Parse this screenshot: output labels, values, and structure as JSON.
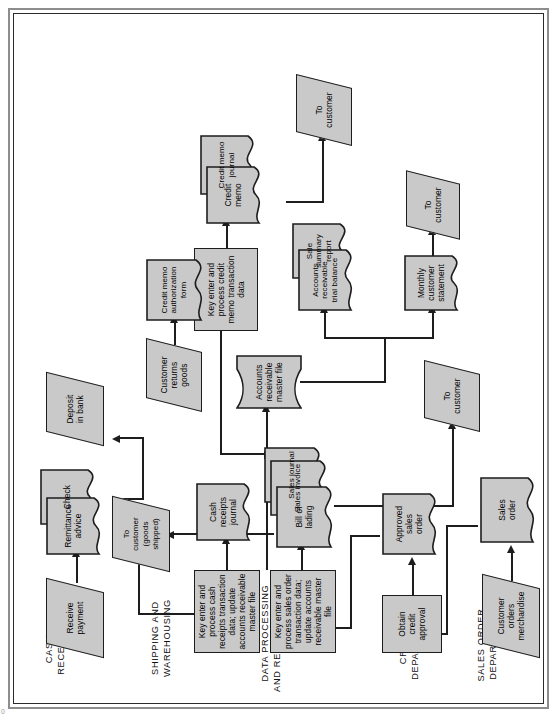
{
  "figure": {
    "kind": "document-flowchart",
    "page_mark": "0",
    "fill_color": "#c9c9c9",
    "line_color": "#1d1d1d",
    "frame_color": "#8d8d8d",
    "orientation": "rotated 90 degrees counter-clockwise (landscape chart on portrait page)"
  },
  "columns": [
    {
      "id": "sales-order",
      "label": "SALES ORDER\nDEPARTMENT"
    },
    {
      "id": "credit",
      "label": "CREDIT\nDEPARTMENT"
    },
    {
      "id": "data-processing",
      "label": "DATA PROCESSING\nAND RECORD KEEPING"
    },
    {
      "id": "shipping",
      "label": "SHIPPING AND\nWAREHOUSING"
    },
    {
      "id": "cash-receipts",
      "label": "CASH\nRECEIPTS"
    }
  ],
  "nodes": {
    "customer_orders": {
      "label": "Customer\norders\nmerchandise",
      "shape": "io"
    },
    "sales_order": {
      "label": "Sales\norder",
      "shape": "document"
    },
    "obtain_credit_approval": {
      "label": "Obtain\ncredit\napproval",
      "shape": "process"
    },
    "approved_sales_order": {
      "label": "Approved\nsales\norder",
      "shape": "document"
    },
    "key_sales_order": {
      "label": "Key enter and\nprocess sales order\ntransaction data;\nupdate accounts\nreceivable master file",
      "shape": "process"
    },
    "key_cash_receipts": {
      "label": "Key enter and\nprocess cash\nreceipts transaction\ndata; update\naccounts receivable\nmaster file",
      "shape": "process"
    },
    "key_credit_memo": {
      "label": "Key enter and\nprocess credit\nmemo transaction\ndata",
      "shape": "process"
    },
    "bill_of_lading": {
      "label": "Bill of\nlading",
      "shape": "document"
    },
    "sales_invoice": {
      "label": "Sales invoice",
      "shape": "document"
    },
    "sales_journal": {
      "label": "Sales journal",
      "shape": "document"
    },
    "cash_receipts_journal": {
      "label": "Cash\nreceipts\njournal",
      "shape": "document"
    },
    "ar_master_file": {
      "label": "Accounts\nreceivable\nmaster file",
      "shape": "magnetic-disk"
    },
    "ar_trial_balance": {
      "label": "Accounts\nreceivable\ntrial balance",
      "shape": "document"
    },
    "sale_summary_report": {
      "label": "Sale summary\nreport",
      "shape": "document"
    },
    "monthly_statement": {
      "label": "Monthly\ncustomer\nstatement",
      "shape": "document"
    },
    "credit_memo": {
      "label": "Credit\nmemo",
      "shape": "document"
    },
    "credit_memo_journal": {
      "label": "Credit memo\njournal",
      "shape": "document"
    },
    "credit_memo_auth_form": {
      "label": "Credit memo\nauthorization\nform",
      "shape": "document"
    },
    "customer_returns_goods": {
      "label": "Customer\nreturns\ngoods",
      "shape": "io"
    },
    "receive_payment": {
      "label": "Receive\npayment",
      "shape": "io"
    },
    "remittance_advice": {
      "label": "Remittance\nadvice",
      "shape": "document"
    },
    "check": {
      "label": "Check",
      "shape": "document"
    },
    "deposit_in_bank": {
      "label": "Deposit\nin bank",
      "shape": "io"
    },
    "to_customer_goods": {
      "label": "To\ncustomer\n(goods\nshipped)",
      "shape": "io"
    },
    "to_customer_invoice": {
      "label": "To\ncustomer",
      "shape": "io"
    },
    "to_customer_statement": {
      "label": "To\ncustomer",
      "shape": "io"
    },
    "to_customer_memo": {
      "label": "To\ncustomer",
      "shape": "io"
    }
  },
  "flows": [
    {
      "from": "customer_orders",
      "to": "sales_order"
    },
    {
      "from": "sales_order",
      "to": "obtain_credit_approval"
    },
    {
      "from": "obtain_credit_approval",
      "to": "approved_sales_order"
    },
    {
      "from": "approved_sales_order",
      "to": "key_sales_order"
    },
    {
      "from": "key_sales_order",
      "to": "bill_of_lading"
    },
    {
      "from": "key_sales_order",
      "to": "ar_master_file"
    },
    {
      "from": "bill_of_lading",
      "to": "to_customer_goods"
    },
    {
      "from": "bill_of_lading",
      "to": "to_customer_invoice"
    },
    {
      "from": "receive_payment",
      "to": "remittance_advice"
    },
    {
      "from": "check",
      "to": "deposit_in_bank"
    },
    {
      "from": "remittance_advice",
      "to": "key_cash_receipts"
    },
    {
      "from": "key_cash_receipts",
      "to": "cash_receipts_journal"
    },
    {
      "from": "key_cash_receipts",
      "to": "ar_master_file"
    },
    {
      "from": "customer_returns_goods",
      "to": "credit_memo_auth_form"
    },
    {
      "from": "credit_memo_auth_form",
      "to": "key_credit_memo"
    },
    {
      "from": "key_credit_memo",
      "to": "credit_memo"
    },
    {
      "from": "credit_memo",
      "to": "to_customer_memo"
    },
    {
      "from": "ar_master_file",
      "to": "ar_trial_balance"
    },
    {
      "from": "ar_master_file",
      "to": "monthly_statement"
    },
    {
      "from": "monthly_statement",
      "to": "to_customer_statement"
    },
    {
      "from": "ar_master_file",
      "to": "key_credit_memo"
    }
  ]
}
